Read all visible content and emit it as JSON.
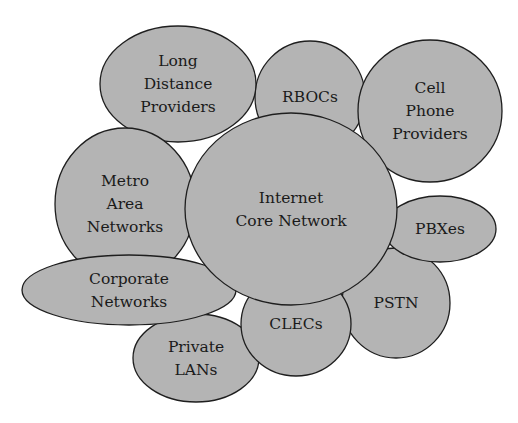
{
  "diagram": {
    "type": "bubble-cluster",
    "title": "",
    "fill_color": "#b4b4b4",
    "stroke_color": "#1e1e1e",
    "background": "#ffffff",
    "nodes": [
      {
        "id": "rbocs",
        "lines": [
          "RBOCs"
        ],
        "cx": 310,
        "cy": 97,
        "rx": 55,
        "ry": 56
      },
      {
        "id": "long-distance-providers",
        "lines": [
          "Long",
          "Distance",
          "Providers"
        ],
        "cx": 178,
        "cy": 84,
        "rx": 78,
        "ry": 58
      },
      {
        "id": "cell-phone-providers",
        "lines": [
          "Cell",
          "Phone",
          "Providers"
        ],
        "cx": 430,
        "cy": 111,
        "rx": 72,
        "ry": 71
      },
      {
        "id": "metro-area-networks",
        "lines": [
          "Metro",
          "Area",
          "Networks"
        ],
        "cx": 125,
        "cy": 204,
        "rx": 70,
        "ry": 76
      },
      {
        "id": "pstn",
        "lines": [
          "PSTN"
        ],
        "cx": 396,
        "cy": 303,
        "rx": 54,
        "ry": 55
      },
      {
        "id": "pbxes",
        "lines": [
          "PBXes"
        ],
        "cx": 440,
        "cy": 229,
        "rx": 56,
        "ry": 33
      },
      {
        "id": "private-lans",
        "lines": [
          "Private",
          "LANs"
        ],
        "cx": 196,
        "cy": 358,
        "rx": 63,
        "ry": 44
      },
      {
        "id": "clecs",
        "lines": [
          "CLECs"
        ],
        "cx": 296,
        "cy": 324,
        "rx": 55,
        "ry": 52
      },
      {
        "id": "corporate-networks",
        "lines": [
          "Corporate",
          "Networks"
        ],
        "cx": 129,
        "cy": 290,
        "rx": 107,
        "ry": 35
      },
      {
        "id": "internet-core-network",
        "lines": [
          "Internet",
          "Core Network"
        ],
        "cx": 291,
        "cy": 209,
        "rx": 106,
        "ry": 96
      }
    ]
  }
}
